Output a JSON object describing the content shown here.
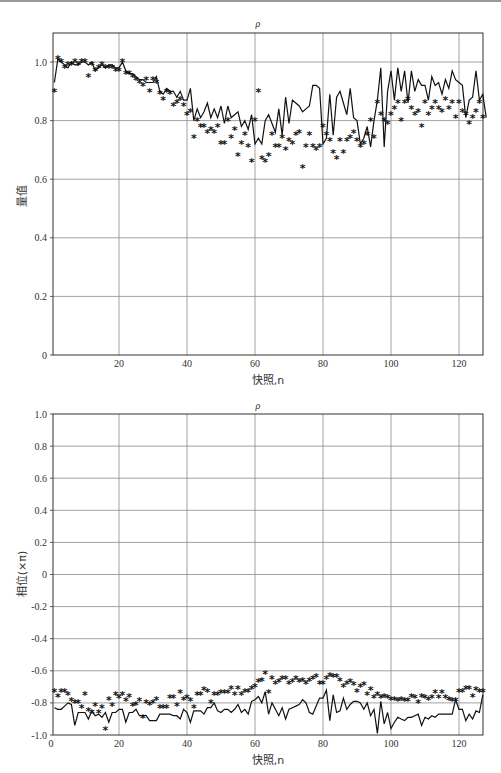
{
  "chart_data": [
    {
      "type": "line",
      "title": "ρ",
      "xlabel": "快照,n",
      "ylabel": "量值",
      "xlim": [
        1,
        127
      ],
      "ylim": [
        0,
        1.1
      ],
      "xticks": [
        20,
        40,
        60,
        80,
        100,
        120
      ],
      "yticks": [
        0,
        0.2,
        0.4,
        0.6,
        0.8,
        1.0
      ],
      "ytick_labels": [
        "0",
        "0.2",
        "0.4",
        "0.6",
        "0.8",
        "1.0"
      ],
      "grid": true,
      "legend": null,
      "series": [
        {
          "name": "estimate (line)",
          "style": "solid-line",
          "values": [
            0.93,
            1.01,
            1.0,
            0.99,
            0.98,
            1.0,
            0.99,
            0.99,
            1.0,
            1.0,
            0.99,
            1.0,
            0.97,
            0.98,
            0.99,
            0.98,
            0.99,
            0.99,
            0.98,
            0.98,
            1.0,
            0.97,
            0.96,
            0.96,
            0.95,
            0.94,
            0.94,
            0.93,
            0.93,
            0.93,
            0.95,
            0.9,
            0.89,
            0.91,
            0.9,
            0.9,
            0.88,
            0.9,
            0.87,
            0.87,
            0.91,
            0.8,
            0.84,
            0.81,
            0.83,
            0.86,
            0.81,
            0.84,
            0.81,
            0.85,
            0.79,
            0.85,
            0.81,
            0.82,
            0.83,
            0.78,
            0.8,
            0.77,
            0.82,
            0.72,
            0.74,
            0.72,
            0.8,
            0.82,
            0.79,
            0.76,
            0.84,
            0.75,
            0.88,
            0.79,
            0.87,
            0.86,
            0.85,
            0.83,
            0.84,
            0.85,
            0.92,
            0.92,
            0.91,
            0.72,
            0.74,
            0.89,
            0.75,
            0.88,
            0.9,
            0.86,
            0.82,
            0.91,
            0.81,
            0.8,
            0.72,
            0.74,
            0.78,
            0.71,
            0.8,
            0.87,
            0.98,
            0.71,
            0.9,
            0.97,
            0.87,
            0.98,
            0.9,
            0.97,
            0.86,
            0.97,
            0.9,
            0.94,
            0.92,
            0.92,
            0.87,
            0.95,
            0.92,
            0.93,
            0.89,
            0.94,
            0.91,
            0.97,
            0.94,
            0.93,
            0.92,
            0.81,
            0.87,
            0.88,
            0.97,
            0.87,
            0.89,
            0.81
          ]
        },
        {
          "name": "true value (asterisk)",
          "style": "asterisk-markers",
          "values": [
            0.9,
            1.01,
            1.0,
            0.98,
            0.99,
            0.99,
            1.0,
            0.99,
            1.0,
            1.0,
            0.95,
            0.99,
            0.97,
            0.98,
            0.99,
            0.98,
            0.98,
            0.98,
            0.97,
            0.97,
            1.0,
            0.96,
            0.96,
            0.95,
            0.94,
            0.93,
            0.92,
            0.94,
            0.9,
            0.94,
            0.93,
            0.89,
            0.87,
            0.9,
            0.89,
            0.85,
            0.86,
            0.87,
            0.85,
            0.82,
            0.83,
            0.74,
            0.8,
            0.78,
            0.78,
            0.76,
            0.77,
            0.76,
            0.78,
            0.72,
            0.72,
            0.8,
            0.74,
            0.77,
            0.68,
            0.72,
            0.75,
            0.71,
            0.66,
            0.8,
            0.9,
            0.67,
            0.66,
            0.68,
            0.75,
            0.71,
            0.71,
            0.74,
            0.7,
            0.73,
            0.72,
            0.75,
            0.76,
            0.64,
            0.71,
            0.75,
            0.71,
            0.7,
            0.71,
            0.78,
            0.75,
            0.73,
            0.69,
            0.67,
            0.73,
            0.69,
            0.73,
            0.74,
            0.76,
            0.73,
            0.71,
            0.72,
            0.75,
            0.8,
            0.74,
            0.86,
            0.82,
            0.8,
            0.79,
            0.82,
            0.84,
            0.86,
            0.8,
            0.86,
            0.87,
            0.84,
            0.82,
            0.83,
            0.78,
            0.86,
            0.82,
            0.84,
            0.86,
            0.84,
            0.83,
            0.87,
            0.84,
            0.86,
            0.81,
            0.86,
            0.83,
            0.82,
            0.79,
            0.81,
            0.83,
            0.86,
            0.81
          ]
        }
      ]
    },
    {
      "type": "line",
      "title": "ρ",
      "xlabel": "快照,n",
      "ylabel": "相位(×π)",
      "xlim": [
        0,
        127
      ],
      "ylim": [
        -1.0,
        1.0
      ],
      "xticks": [
        0,
        20,
        40,
        60,
        80,
        100,
        120
      ],
      "yticks": [
        -1.0,
        -0.8,
        -0.6,
        -0.4,
        -0.2,
        0,
        0.2,
        0.4,
        0.6,
        0.8,
        1.0
      ],
      "ytick_labels": [
        "-1.0",
        "-0.8",
        "-0.6",
        "-0.4",
        "-0.2",
        "0",
        "0.2",
        "0.4",
        "0.6",
        "0.8",
        "1.0"
      ],
      "grid": true,
      "legend": null,
      "series": [
        {
          "name": "estimate (line)",
          "style": "solid-line",
          "values": [
            -0.83,
            -0.84,
            -0.84,
            -0.82,
            -0.8,
            -0.81,
            -0.94,
            -0.86,
            -0.86,
            -0.86,
            -0.9,
            -0.85,
            -0.88,
            -0.87,
            -0.89,
            -0.86,
            -0.92,
            -0.86,
            -0.86,
            -0.84,
            -0.84,
            -0.92,
            -0.86,
            -0.86,
            -0.84,
            -0.88,
            -0.88,
            -0.88,
            -0.91,
            -0.91,
            -0.91,
            -0.87,
            -0.87,
            -0.87,
            -0.87,
            -0.88,
            -0.88,
            -0.9,
            -0.84,
            -0.86,
            -0.92,
            -0.85,
            -0.85,
            -0.85,
            -0.87,
            -0.83,
            -0.83,
            -0.8,
            -0.85,
            -0.86,
            -0.84,
            -0.84,
            -0.86,
            -0.84,
            -0.81,
            -0.86,
            -0.84,
            -0.87,
            -0.79,
            -0.78,
            -0.76,
            -0.8,
            -0.73,
            -0.87,
            -0.8,
            -0.84,
            -0.88,
            -0.83,
            -0.9,
            -0.84,
            -0.83,
            -0.82,
            -0.81,
            -0.78,
            -0.8,
            -0.86,
            -0.87,
            -0.82,
            -0.77,
            -0.77,
            -0.72,
            -0.91,
            -0.75,
            -0.86,
            -0.85,
            -0.77,
            -0.84,
            -0.81,
            -0.79,
            -0.79,
            -0.8,
            -0.84,
            -0.8,
            -0.88,
            -0.84,
            -0.99,
            -0.79,
            -0.93,
            -0.86,
            -0.96,
            -0.92,
            -0.89,
            -0.9,
            -0.91,
            -0.89,
            -0.89,
            -0.88,
            -0.87,
            -0.94,
            -0.89,
            -0.9,
            -0.88,
            -0.89,
            -0.87,
            -0.87,
            -0.87,
            -0.87,
            -0.87,
            -0.78,
            -0.84,
            -0.84,
            -0.91,
            -0.87,
            -0.9,
            -0.85,
            -0.86,
            -0.75
          ]
        },
        {
          "name": "true value (asterisk)",
          "style": "asterisk-markers",
          "values": [
            -0.73,
            -0.76,
            -0.73,
            -0.73,
            -0.75,
            -0.79,
            -0.8,
            -0.8,
            -0.83,
            -0.75,
            -0.85,
            -0.86,
            -0.82,
            -0.86,
            -0.83,
            -0.97,
            -0.78,
            -0.82,
            -0.75,
            -0.77,
            -0.75,
            -0.79,
            -0.76,
            -0.82,
            -0.81,
            -0.79,
            -0.89,
            -0.8,
            -0.81,
            -0.8,
            -0.78,
            -0.83,
            -0.83,
            -0.83,
            -0.77,
            -0.77,
            -0.82,
            -0.74,
            -0.78,
            -0.77,
            -0.79,
            -0.83,
            -0.75,
            -0.75,
            -0.72,
            -0.73,
            -0.8,
            -0.75,
            -0.75,
            -0.74,
            -0.74,
            -0.74,
            -0.71,
            -0.75,
            -0.71,
            -0.75,
            -0.73,
            -0.73,
            -0.71,
            -0.7,
            -0.67,
            -0.66,
            -0.62,
            -0.74,
            -0.65,
            -0.68,
            -0.67,
            -0.65,
            -0.65,
            -0.68,
            -0.67,
            -0.65,
            -0.67,
            -0.66,
            -0.68,
            -0.66,
            -0.65,
            -0.64,
            -0.68,
            -0.68,
            -0.65,
            -0.63,
            -0.64,
            -0.64,
            -0.66,
            -0.7,
            -0.68,
            -0.67,
            -0.69,
            -0.73,
            -0.7,
            -0.69,
            -0.75,
            -0.72,
            -0.77,
            -0.75,
            -0.77,
            -0.76,
            -0.77,
            -0.78,
            -0.78,
            -0.79,
            -0.78,
            -0.79,
            -0.79,
            -0.76,
            -0.77,
            -0.8,
            -0.76,
            -0.77,
            -0.78,
            -0.77,
            -0.74,
            -0.77,
            -0.74,
            -0.77,
            -0.78,
            -0.79,
            -0.79,
            -0.73,
            -0.73,
            -0.71,
            -0.71,
            -0.76,
            -0.72,
            -0.73,
            -0.73
          ]
        }
      ]
    }
  ],
  "charts": {
    "top": {
      "title": "ρ",
      "xlabel": "快照,n",
      "ylabel": "量值"
    },
    "bottom": {
      "title": "ρ",
      "xlabel": "快照,n",
      "ylabel": "相位(×π)"
    }
  },
  "colors": {
    "line": "#1a1a1a",
    "grid": "#8a8a8a",
    "axis": "#333333"
  }
}
